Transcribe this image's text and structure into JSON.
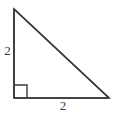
{
  "figure": {
    "kind": "right-triangle-diagram",
    "background_color": "#ffffff",
    "stroke_color": "#3a3a3a",
    "stroke_width": 1.6,
    "label_color": "#3a3a3a",
    "vertices": {
      "top": {
        "x": 14,
        "y": 9
      },
      "bottom_left": {
        "x": 14,
        "y": 98
      },
      "bottom_right": {
        "x": 109,
        "y": 98
      }
    },
    "right_angle_marker": {
      "at_vertex": "bottom_left",
      "size": 13,
      "filled": false
    },
    "labels": {
      "vertical_leg": "2",
      "horizontal_leg": "2"
    }
  }
}
